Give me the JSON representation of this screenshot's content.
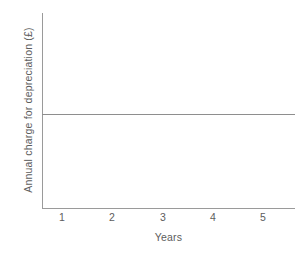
{
  "chart_data": {
    "type": "line",
    "title": "",
    "subtitle": "",
    "xlabel": "Years",
    "ylabel": "Annual charge for depreciation (£)",
    "x": [
      1,
      2,
      3,
      4,
      5
    ],
    "xtick_labels": [
      "1",
      "2",
      "3",
      "4",
      "5"
    ],
    "ytick_labels": [],
    "series": [
      {
        "name": "Annual depreciation charge",
        "values": [
          1,
          1,
          1,
          1,
          1
        ]
      }
    ],
    "xlim": [
      0.5,
      5.5
    ],
    "ylim": [
      0,
      2.1
    ],
    "grid": false,
    "legend": false,
    "legend_position": "none",
    "annotations": [],
    "colors": {
      "axis": "#9a9a9a",
      "series_line": "#8e8e8e",
      "text": "#5d5d5d",
      "background": "#ffffff"
    }
  },
  "geometry": {
    "x_tick_positions_px": [
      62,
      112,
      163,
      213,
      263
    ],
    "series_y_px": 114
  }
}
